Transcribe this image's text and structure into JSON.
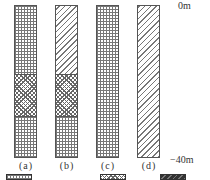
{
  "diagram": {
    "depth_top": "0m",
    "depth_bottom": "−40m",
    "columns": [
      {
        "label": "(a)",
        "layers": [
          "grid",
          "cross-hatch",
          "grid"
        ]
      },
      {
        "label": "(b)",
        "layers": [
          "diagonal-hatch",
          "cross-hatch",
          "grid"
        ]
      },
      {
        "label": "(c)",
        "layers": [
          "grid"
        ]
      },
      {
        "label": "(d)",
        "layers": [
          "diagonal-hatch"
        ]
      }
    ],
    "legend": [
      {
        "pattern": "grid",
        "text": ""
      },
      {
        "pattern": "cross-hatch",
        "text": ""
      },
      {
        "pattern": "diagonal-hatch",
        "text": ""
      }
    ]
  }
}
